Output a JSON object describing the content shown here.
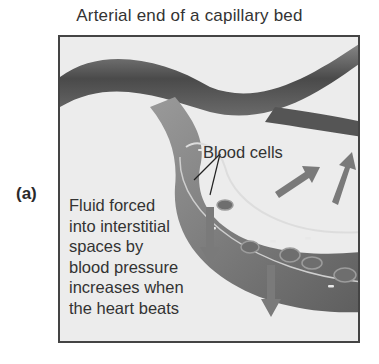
{
  "figure": {
    "title": "Arterial end of a capillary bed",
    "panel_label": "(a)",
    "labels": {
      "blood_cells": "Blood cells",
      "fluid_lines": [
        "Fluid forced",
        "into interstitial",
        "spaces by",
        "blood pressure",
        "increases when",
        "the heart beats"
      ]
    },
    "colors": {
      "vessel": "#5a5a5a",
      "arrow": "#7a7a7a",
      "background": "#ececec",
      "border": "#444444"
    }
  }
}
